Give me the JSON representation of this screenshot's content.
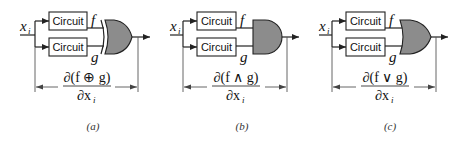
{
  "panels": [
    {
      "id": "a",
      "gate_type": "XOR",
      "input_label": "x",
      "input_subscript": "i",
      "box_top_label": "Circuit",
      "box_bottom_label": "Circuit",
      "output_top_label": "f",
      "output_bottom_label": "g",
      "numerator": "∂(f ⊕ g)",
      "denominator": "∂x",
      "denominator_subscript": "i",
      "caption": "(a)"
    },
    {
      "id": "b",
      "gate_type": "AND",
      "input_label": "x",
      "input_subscript": "i",
      "box_top_label": "Circuit",
      "box_bottom_label": "Circuit",
      "output_top_label": "f",
      "output_bottom_label": "g",
      "numerator": "∂(f ∧ g)",
      "denominator": "∂x",
      "denominator_subscript": "i",
      "caption": "(b)"
    },
    {
      "id": "c",
      "gate_type": "OR",
      "input_label": "x",
      "input_subscript": "i",
      "box_top_label": "Circuit",
      "box_bottom_label": "Circuit",
      "output_top_label": "f",
      "output_bottom_label": "g",
      "numerator": "∂(f ∨ g)",
      "denominator": "∂x",
      "denominator_subscript": "i",
      "caption": "(c)"
    }
  ],
  "colors": {
    "gate_fill": "#8c8c8c",
    "line": "#222222",
    "background": "#ffffff"
  }
}
